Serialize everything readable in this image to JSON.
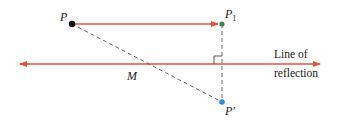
{
  "diagram": {
    "labels": {
      "P": "P",
      "P1_main": "P",
      "P1_sub": "1",
      "P_prime": "P′",
      "M": "M",
      "line_text_1": "Line of",
      "line_text_2": "reflection"
    },
    "colors": {
      "line": "#e0533a",
      "dashed": "#555555",
      "point_P": "#111111",
      "point_P1": "#2e8b57",
      "point_P_prime": "#2a8fd6"
    }
  }
}
